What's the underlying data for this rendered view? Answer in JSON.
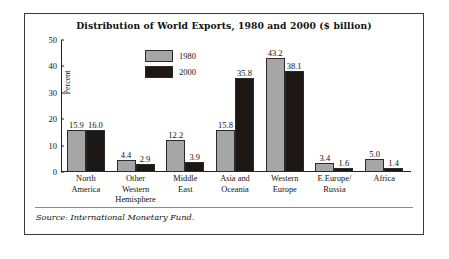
{
  "figure": {
    "title": "Distribution of World Exports, 1980 and 2000 ($ billion)",
    "source": "Source: International Monetary Fund."
  },
  "chart_data": {
    "type": "bar",
    "title": "Distribution of World Exports, 1980 and 2000 ($ billion)",
    "xlabel": "",
    "ylabel": "Percent",
    "ylim": [
      0,
      50
    ],
    "yticks": [
      0,
      10,
      20,
      30,
      40,
      50
    ],
    "grid": false,
    "legend_position": "inside-top-left",
    "categories": [
      "North America",
      "Other Western Hemisphere",
      "Middle East",
      "Asia and Oceania",
      "Western Europe",
      "E.Europe/ Russia",
      "Africa"
    ],
    "category_lines": [
      [
        "North",
        "America"
      ],
      [
        "Other",
        "Western",
        "Hemisphere"
      ],
      [
        "Middle",
        "East"
      ],
      [
        "Asia and",
        "Oceania"
      ],
      [
        "Western",
        "Europe"
      ],
      [
        "E.Europe/",
        "Russia"
      ],
      [
        "Africa"
      ]
    ],
    "series": [
      {
        "name": "1980",
        "color": "#a6a6a6",
        "values": [
          15.9,
          4.4,
          12.2,
          15.8,
          43.2,
          3.4,
          5.0
        ],
        "labels": [
          "15.9",
          "4.4",
          "12.2",
          "15.8",
          "43.2",
          "3.4",
          "5.0"
        ]
      },
      {
        "name": "2000",
        "color": "#1c1712",
        "values": [
          16.0,
          2.9,
          3.9,
          35.8,
          38.1,
          1.6,
          1.4
        ],
        "labels": [
          "16.0",
          "2.9",
          "3.9",
          "35.8",
          "38.1",
          "1.6",
          "1.4"
        ]
      }
    ]
  }
}
